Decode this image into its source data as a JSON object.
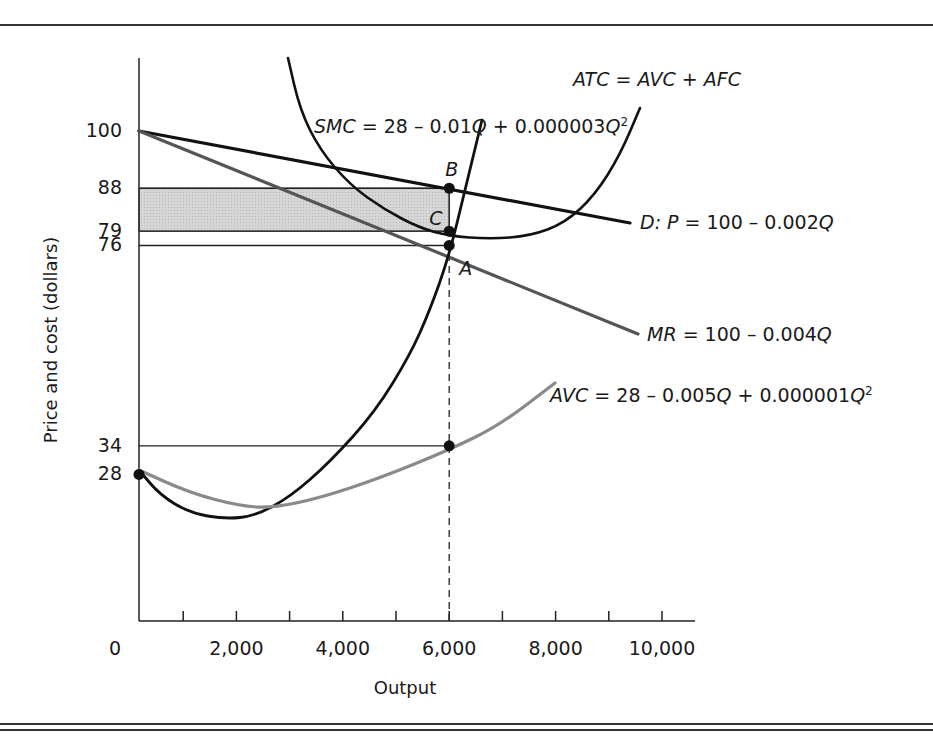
{
  "chart_data": {
    "type": "line",
    "title": "",
    "xlabel": "Output",
    "ylabel": "Price and cost (dollars)",
    "xlim": [
      0,
      10000
    ],
    "ylim": [
      0,
      110
    ],
    "grid": false,
    "x_ticks": [
      0,
      1000,
      2000,
      3000,
      4000,
      5000,
      6000,
      7000,
      8000,
      9000,
      10000
    ],
    "x_tick_labels": [
      "0",
      "2,000",
      "4,000",
      "6,000",
      "8,000",
      "10,000"
    ],
    "x_tick_label_values": [
      0,
      2000,
      4000,
      6000,
      8000,
      10000
    ],
    "y_tick_labels": [
      "100",
      "88",
      "79",
      "76",
      "34",
      "28"
    ],
    "y_tick_values": [
      100,
      88,
      79,
      76,
      34,
      28
    ],
    "series": [
      {
        "name": "D: P = 100 – 0.002Q",
        "id": "demand",
        "label_main": "D: P",
        "label_rest": " = 100 – 0.002",
        "label_q": "Q",
        "color": "#111111",
        "x": [
          0,
          9500
        ],
        "values": [
          100,
          81
        ]
      },
      {
        "name": "MR = 100 – 0.004Q",
        "id": "mr",
        "label_main": "MR",
        "label_rest": " = 100 – 0.004",
        "label_q": "Q",
        "color": "#555555",
        "x": [
          0,
          9500
        ],
        "values": [
          100,
          62
        ]
      },
      {
        "name": "SMC = 28 – 0.01Q + 0.000003Q²",
        "id": "smc",
        "label_main": "SMC",
        "label_rest": " = 28 – 0.01",
        "label_q": "Q",
        "label_rest2": " + 0.000003",
        "label_q2": "Q",
        "label_sup": "2",
        "color": "#111111",
        "x": [
          0,
          500,
          1000,
          1500,
          2000,
          2500,
          3000,
          3500,
          4000,
          4500,
          5000,
          5500,
          6000,
          6500
        ],
        "values": [
          28,
          23.75,
          21,
          19.75,
          20,
          21.75,
          25,
          29.75,
          36,
          43.75,
          53,
          63.75,
          76,
          89.75
        ]
      },
      {
        "name": "AVC = 28 – 0.005Q + 0.000001Q²",
        "id": "avc",
        "label_main": "AVC",
        "label_rest": " = 28 – 0.005",
        "label_q": "Q",
        "label_rest2": " + 0.000001",
        "label_q2": "Q",
        "label_sup": "2",
        "color": "#8a8a8a",
        "x": [
          0,
          500,
          1000,
          1500,
          2000,
          2500,
          3000,
          3500,
          4000,
          4500,
          5000,
          5500,
          6000,
          6500,
          7000,
          7500,
          8000
        ],
        "values": [
          28,
          25.75,
          24,
          22.75,
          22,
          21.75,
          22,
          22.75,
          24,
          25.75,
          28,
          30.75,
          34,
          37.75,
          42,
          46.75,
          52
        ]
      },
      {
        "name": "ATC = AVC + AFC",
        "id": "atc",
        "label_main": "ATC",
        "label_rest": " = ",
        "label_avc": "AVC",
        "label_plus": " + ",
        "label_afc": "AFC",
        "color": "#111111",
        "x": [
          2900,
          3300,
          3800,
          4400,
          5000,
          5500,
          6000,
          6500,
          7000,
          7500,
          8000,
          8500,
          9000
        ],
        "values": [
          112,
          104,
          96,
          89,
          84,
          81,
          79,
          78.5,
          79.5,
          82,
          87,
          95,
          106
        ]
      }
    ],
    "points": [
      {
        "label": "B",
        "x": 6000,
        "y": 88,
        "desc": "price on demand curve"
      },
      {
        "label": "C",
        "x": 6000,
        "y": 79,
        "desc": "ATC at optimum output"
      },
      {
        "label": "A",
        "x": 6000,
        "y": 76,
        "desc": "MR = SMC"
      },
      {
        "label": "",
        "x": 6000,
        "y": 34,
        "desc": "AVC at optimum output"
      },
      {
        "label": "",
        "x": 0,
        "y": 28,
        "desc": "SMC = AVC intercept"
      }
    ],
    "reference_lines": [
      {
        "type": "horizontal",
        "y": 88,
        "x_to": 6000
      },
      {
        "type": "horizontal",
        "y": 79,
        "x_to": 6000
      },
      {
        "type": "horizontal",
        "y": 76,
        "x_to": 6000
      },
      {
        "type": "horizontal",
        "y": 34,
        "x_to": 6000
      },
      {
        "type": "vertical-dashed",
        "x": 6000,
        "y_from": 0,
        "y_to": 76
      }
    ],
    "shaded_region": {
      "x_from": 0,
      "x_to": 6000,
      "y_from": 79,
      "y_to": 88,
      "meaning": "economic profit",
      "color": "#d4d4d4"
    }
  }
}
